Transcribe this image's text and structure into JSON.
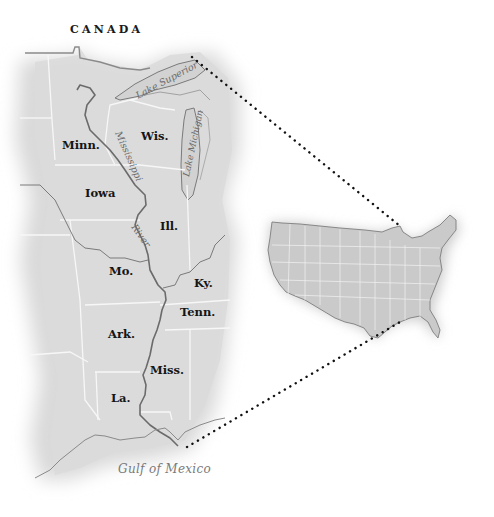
{
  "map": {
    "title": "Mississippi River region and United States locator",
    "country_label": "CANADA",
    "water_labels": {
      "lake_superior": "Lake Superior",
      "lake_michigan": "Lake Michigan",
      "river_top": "Mississippi",
      "river_bottom": "River",
      "gulf": "Gulf of Mexico"
    },
    "states": [
      {
        "id": "minn",
        "label": "Minn."
      },
      {
        "id": "wis",
        "label": "Wis."
      },
      {
        "id": "iowa",
        "label": "Iowa"
      },
      {
        "id": "ill",
        "label": "Ill."
      },
      {
        "id": "mo",
        "label": "Mo."
      },
      {
        "id": "ky",
        "label": "Ky."
      },
      {
        "id": "tenn",
        "label": "Tenn."
      },
      {
        "id": "ark",
        "label": "Ark."
      },
      {
        "id": "miss",
        "label": "Miss."
      },
      {
        "id": "la",
        "label": "La."
      }
    ],
    "colors": {
      "land": "#dcdcdc",
      "border": "#f7f7f7",
      "river": "#6b6b6b",
      "label": "#151515",
      "dots": "#111111"
    },
    "inset": {
      "name": "Contiguous United States locator map",
      "connector_style": "dotted"
    }
  }
}
